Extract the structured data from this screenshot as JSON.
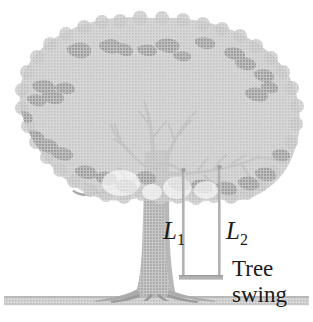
{
  "figure": {
    "background_color": "#ffffff",
    "labels": {
      "rope_left": {
        "symbol": "L",
        "subscript": "1",
        "full": "L1"
      },
      "rope_right": {
        "symbol": "L",
        "subscript": "2",
        "full": "L2"
      },
      "caption_line1": "Tree",
      "caption_line2": "swing"
    },
    "colors": {
      "canopy_fill": "#c9c9c9",
      "canopy_dark_cluster": "#9a9a9a",
      "trunk_fill": "#b4b4b4",
      "trunk_edge": "#9c9c9c",
      "branch_fill": "#b0b0b0",
      "ground_fill": "#c4c4c4",
      "rope_stroke": "#a8a8a8",
      "seat_fill": "#b6b6b6",
      "text_color": "#1a1a1a"
    },
    "elements": {
      "canopy_name": "tree-canopy",
      "trunk_name": "tree-trunk",
      "branches_name": "tree-branches",
      "ground_name": "ground-line",
      "swing_rope_left_name": "swing-rope-left",
      "swing_rope_right_name": "swing-rope-right",
      "swing_seat_name": "swing-seat"
    }
  }
}
